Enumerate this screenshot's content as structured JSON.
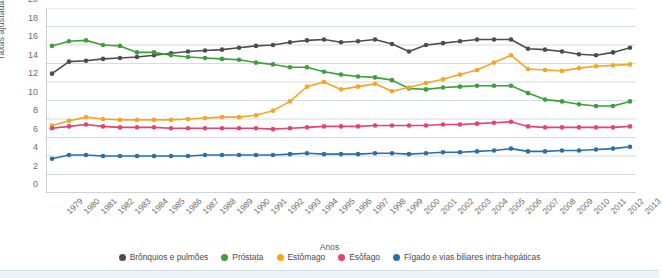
{
  "chart_data": {
    "type": "line",
    "title": "",
    "xlabel": "Anos",
    "ylabel": "Taxas ajustadas",
    "ylim": [
      0,
      20
    ],
    "yticks": [
      0,
      2,
      4,
      6,
      8,
      10,
      12,
      14,
      16,
      18,
      20
    ],
    "grid": true,
    "legend_position": "bottom",
    "categories": [
      "1979",
      "1980",
      "1981",
      "1982",
      "1983",
      "1984",
      "1985",
      "1986",
      "1987",
      "1988",
      "1989",
      "1990",
      "1991",
      "1992",
      "1993",
      "1994",
      "1995",
      "1996",
      "1997",
      "1998",
      "1999",
      "2000",
      "2001",
      "2002",
      "2003",
      "2004",
      "2005",
      "2006",
      "2007",
      "2008",
      "2009",
      "2010",
      "2011",
      "2012",
      "2013"
    ],
    "series": [
      {
        "name": "Brônquios e pulmões",
        "color": "#4d4d4d",
        "values": [
          12.9,
          14.2,
          14.3,
          14.5,
          14.6,
          14.7,
          14.9,
          15.1,
          15.3,
          15.4,
          15.5,
          15.7,
          15.9,
          16.0,
          16.3,
          16.5,
          16.6,
          16.3,
          16.4,
          16.6,
          16.1,
          15.3,
          16.0,
          16.2,
          16.4,
          16.6,
          16.6,
          16.6,
          15.6,
          15.5,
          15.3,
          15.0,
          14.9,
          15.2,
          15.7
        ]
      },
      {
        "name": "Próstata",
        "color": "#3aa03a",
        "values": [
          15.9,
          16.4,
          16.5,
          16.0,
          15.9,
          15.2,
          15.2,
          14.9,
          14.7,
          14.6,
          14.5,
          14.4,
          14.1,
          13.9,
          13.6,
          13.6,
          13.1,
          12.8,
          12.6,
          12.5,
          12.2,
          11.3,
          11.2,
          11.4,
          11.5,
          11.6,
          11.6,
          11.6,
          10.8,
          10.1,
          9.9,
          9.6,
          9.4,
          9.4,
          9.9
        ]
      },
      {
        "name": "Estômago",
        "color": "#f5a623",
        "values": [
          7.3,
          7.8,
          8.2,
          8.0,
          7.9,
          7.9,
          7.9,
          7.9,
          8.0,
          8.1,
          8.2,
          8.2,
          8.4,
          8.9,
          9.9,
          11.5,
          12.0,
          11.2,
          11.5,
          11.8,
          11.0,
          11.4,
          11.9,
          12.3,
          12.8,
          13.3,
          14.1,
          14.9,
          13.4,
          13.3,
          13.2,
          13.5,
          13.7,
          13.8,
          13.9
        ]
      },
      {
        "name": "Esôfago",
        "color": "#e8416f",
        "values": [
          7.0,
          7.2,
          7.4,
          7.2,
          7.1,
          7.1,
          7.1,
          7.0,
          7.0,
          7.0,
          7.0,
          7.0,
          7.0,
          6.9,
          7.0,
          7.1,
          7.2,
          7.2,
          7.2,
          7.3,
          7.3,
          7.3,
          7.3,
          7.4,
          7.4,
          7.5,
          7.6,
          7.7,
          7.2,
          7.1,
          7.1,
          7.1,
          7.1,
          7.1,
          7.2
        ]
      },
      {
        "name": "Fígado e vias biliares intra-hepáticas",
        "color": "#2a6fa8",
        "values": [
          3.7,
          4.1,
          4.1,
          4.0,
          4.0,
          4.0,
          4.0,
          4.0,
          4.0,
          4.1,
          4.1,
          4.1,
          4.1,
          4.1,
          4.2,
          4.3,
          4.2,
          4.2,
          4.2,
          4.3,
          4.3,
          4.2,
          4.3,
          4.4,
          4.4,
          4.5,
          4.6,
          4.8,
          4.5,
          4.5,
          4.6,
          4.6,
          4.7,
          4.8,
          5.0
        ]
      }
    ]
  }
}
